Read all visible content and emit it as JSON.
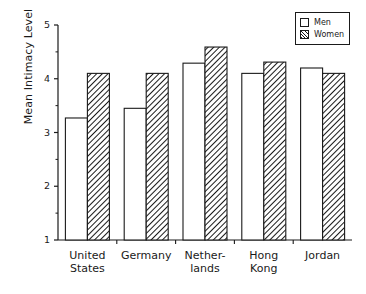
{
  "chart_data": {
    "type": "bar",
    "title": "",
    "subtitle": "",
    "xlabel": "",
    "ylabel": "Mean Intimacy Level",
    "ylim": [
      1,
      5
    ],
    "yticks": [
      1,
      2,
      3,
      4,
      5
    ],
    "ytick_labels": [
      "1",
      "2",
      "3",
      "4",
      "5"
    ],
    "minor_ticks": [
      1.5,
      2.5,
      3.5,
      4.5
    ],
    "grid": false,
    "legend_position": "top-right",
    "categories": [
      "United\nStates",
      "Germany",
      "Nether-\nlands",
      "Hong\nKong",
      "Jordan"
    ],
    "series": [
      {
        "name": "Men",
        "values": [
          3.27,
          3.45,
          4.29,
          4.1,
          4.2
        ],
        "fill": "solid-white",
        "color": "#ffffff"
      },
      {
        "name": "Women",
        "values": [
          4.1,
          4.1,
          4.59,
          4.31,
          4.1
        ],
        "fill": "diagonal-hatch",
        "color": "#1a1a1a"
      }
    ]
  },
  "legend": {
    "items": [
      {
        "label": "Men",
        "swatch": "white-box"
      },
      {
        "label": "Women",
        "swatch": "hatched-box"
      }
    ]
  },
  "colors": {
    "axis": "#1a1a1a",
    "bar_outline": "#1a1a1a",
    "men_fill": "#ffffff",
    "women_hatch": "#1a1a1a",
    "background": "#ffffff"
  }
}
